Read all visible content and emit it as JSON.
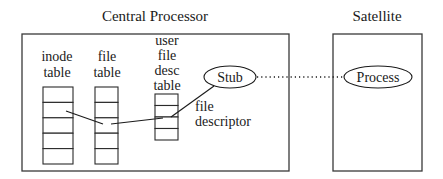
{
  "diagram": {
    "central": {
      "title": "Central Processor",
      "inode_table": {
        "label_lines": [
          "inode",
          "table"
        ],
        "cell_count": 5
      },
      "file_table": {
        "label_lines": [
          "file",
          "table"
        ],
        "cell_count": 5
      },
      "user_fd_table": {
        "label_lines": [
          "user",
          "file",
          "desc",
          "table"
        ],
        "cell_count": 4
      },
      "stub": {
        "label": "Stub"
      },
      "fd_annotation": [
        "file",
        "descriptor"
      ]
    },
    "satellite": {
      "title": "Satellite",
      "process": {
        "label": "Process"
      }
    },
    "connections": [
      {
        "from": "inode-table-cell-2",
        "to": "file-table-cell-3",
        "style": "solid"
      },
      {
        "from": "file-table-cell-3",
        "to": "user-fd-table-cell-2",
        "style": "solid"
      },
      {
        "from": "user-fd-table-cell-2",
        "to": "stub",
        "style": "solid"
      },
      {
        "from": "stub",
        "to": "process",
        "style": "dotted"
      }
    ]
  }
}
